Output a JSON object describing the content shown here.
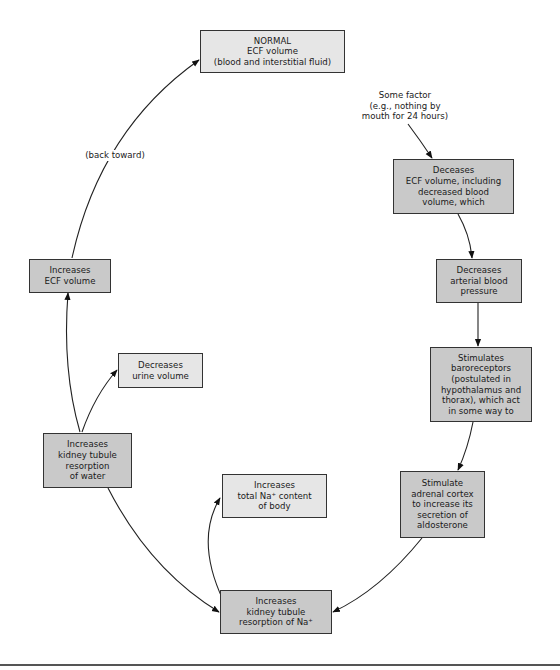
{
  "diagram": {
    "nodes": {
      "normal": {
        "text": "NORMAL\nECF volume\n(blood and interstitial fluid)"
      },
      "factor": {
        "text": "Some factor\n(e.g., nothing by\nmouth for 24 hours)"
      },
      "decreases_ecf": {
        "text": "Deceases\nECF volume, including\ndecreased blood\nvolume, which"
      },
      "decreases_bp": {
        "text": "Decreases\narterial blood\npressure"
      },
      "baroreceptors": {
        "text": "Stimulates\nbaroreceptors\n(postulated in\nhypothalamus and\nthorax), which act\nin some way to"
      },
      "adrenal": {
        "text": "Stimulate\nadrenal cortex\nto increase its\nsecretion of\naldosterone"
      },
      "kidney_na": {
        "text": "Increases\nkidney tubule\nresorption of Na⁺"
      },
      "total_na": {
        "text": "Increases\ntotal Na⁺ content\nof body"
      },
      "kidney_water": {
        "text": "Increases\nkidney tubule\nresorption\nof water"
      },
      "urine": {
        "text": "Decreases\nurine volume"
      },
      "increases_ecf": {
        "text": "Increases\nECF volume"
      }
    },
    "edge_labels": {
      "back_toward": "(back toward)"
    },
    "edges": [
      {
        "from": "factor",
        "to": "decreases_ecf"
      },
      {
        "from": "decreases_ecf",
        "to": "decreases_bp"
      },
      {
        "from": "decreases_bp",
        "to": "baroreceptors"
      },
      {
        "from": "baroreceptors",
        "to": "adrenal"
      },
      {
        "from": "adrenal",
        "to": "kidney_na"
      },
      {
        "from": "kidney_na",
        "to": "total_na"
      },
      {
        "from": "kidney_na",
        "to": "kidney_water"
      },
      {
        "from": "kidney_water",
        "to": "urine"
      },
      {
        "from": "kidney_water",
        "to": "increases_ecf"
      },
      {
        "from": "increases_ecf",
        "to": "normal",
        "label": "(back toward)"
      }
    ],
    "colors": {
      "dark_box": "#c9c9c9",
      "light_box": "#e6e6e6",
      "border": "#333333"
    }
  }
}
